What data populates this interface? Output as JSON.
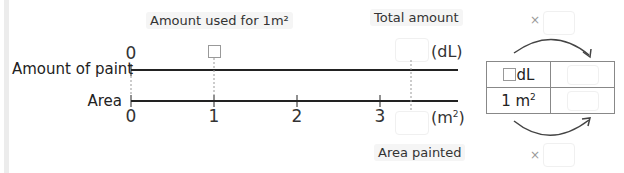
{
  "labels": {
    "amount_used_per_m2": "Amount used for 1m²",
    "total_amount": "Total amount",
    "area_painted": "Area painted"
  },
  "number_line": {
    "top_row_label": "Amount of paint",
    "bottom_row_label": "Area",
    "top_zero": "0",
    "top_unit": "(dL)",
    "bottom_unit_base": "(m",
    "bottom_unit_sup": "2",
    "bottom_unit_close": ")",
    "ticks": [
      "0",
      "1",
      "2",
      "3"
    ]
  },
  "ratio_table": {
    "row1_unit": "dL",
    "row2_base": "1 m",
    "row2_sup": "2",
    "times_symbol": "×"
  },
  "colors": {
    "line": "#222222",
    "caption_bg": "#f5f5f5",
    "arrow": "#444444"
  }
}
